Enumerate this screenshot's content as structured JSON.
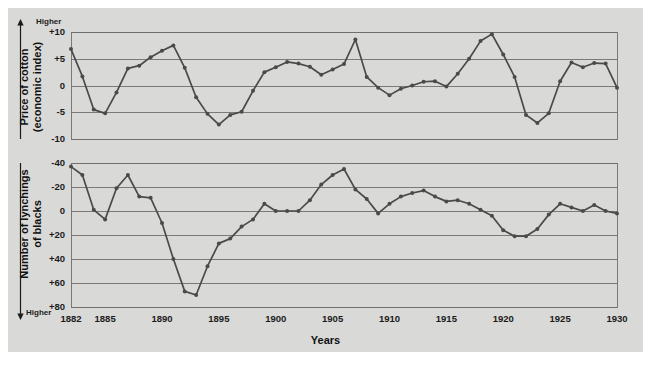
{
  "figure": {
    "background_color": "#d9d9d7",
    "page_color": "#ffffff",
    "line_color": "#4a4a4a",
    "grid_color": "#6f6f6f",
    "text_color": "#1b1b1b",
    "x_axis_label": "Years",
    "higher_top_label": "Higher",
    "higher_bottom_label": "Higher"
  },
  "chart_data": [
    {
      "type": "line",
      "id": "cotton-price",
      "title": "",
      "ylabel": "Price of cotton (economic index)",
      "ylabel_line1": "Price of cotton",
      "ylabel_line2": "(economic index)",
      "xlabel": "Years",
      "grid": true,
      "legend": "none",
      "axis_direction_note": "arrow points up, labelled Higher",
      "ylim": [
        -10,
        10
      ],
      "yticks": [
        10,
        5,
        0,
        -5,
        -10
      ],
      "ytick_labels": [
        "+10",
        "+5",
        "0",
        "-5",
        "-10"
      ],
      "xlim": [
        1882,
        1930
      ],
      "xticks": [
        1882,
        1885,
        1890,
        1895,
        1900,
        1905,
        1910,
        1915,
        1920,
        1925,
        1930
      ],
      "xtick_labels": [
        "1882",
        "1885",
        "1890",
        "1895",
        "1900",
        "1905",
        "1910",
        "1915",
        "1920",
        "1925",
        "1930"
      ],
      "x": [
        1882,
        1883,
        1884,
        1885,
        1886,
        1887,
        1888,
        1889,
        1890,
        1891,
        1892,
        1893,
        1894,
        1895,
        1896,
        1897,
        1898,
        1899,
        1900,
        1901,
        1902,
        1903,
        1904,
        1905,
        1906,
        1907,
        1908,
        1909,
        1910,
        1911,
        1912,
        1913,
        1914,
        1915,
        1916,
        1917,
        1918,
        1919,
        1920,
        1921,
        1922,
        1923,
        1924,
        1925,
        1926,
        1927,
        1928,
        1929,
        1930
      ],
      "y": [
        6.8,
        1.7,
        -4.5,
        -5.2,
        -1.3,
        3.2,
        3.7,
        5.3,
        6.5,
        7.5,
        3.3,
        -2.2,
        -5.3,
        -7.3,
        -5.5,
        -4.9,
        -1.0,
        2.5,
        3.4,
        4.4,
        4.1,
        3.5,
        2.0,
        3.0,
        4.0,
        8.6,
        1.6,
        -0.4,
        -1.8,
        -0.6,
        0.0,
        0.7,
        0.8,
        -0.2,
        2.2,
        5.0,
        8.3,
        9.6,
        5.8,
        1.6,
        -5.5,
        -7.0,
        -5.2,
        0.8,
        4.3,
        3.4,
        4.2,
        4.1,
        -0.4,
        -11.0
      ]
    },
    {
      "type": "line",
      "id": "lynchings",
      "title": "",
      "ylabel": "Number of lynchings of blacks",
      "ylabel_line1": "Number of lynchings",
      "ylabel_line2": "of blacks",
      "xlabel": "Years",
      "grid": true,
      "legend": "none",
      "axis_direction_note": "axis inverted, arrow points down, labelled Higher",
      "ylim": [
        -40,
        80
      ],
      "yticks": [
        -40,
        -20,
        0,
        20,
        40,
        60,
        80
      ],
      "ytick_labels": [
        "-40",
        "-20",
        "0",
        "+20",
        "+40",
        "+60",
        "+80"
      ],
      "xlim": [
        1882,
        1930
      ],
      "xticks": [
        1882,
        1885,
        1890,
        1895,
        1900,
        1905,
        1910,
        1915,
        1920,
        1925,
        1930
      ],
      "xtick_labels": [
        "1882",
        "1885",
        "1890",
        "1895",
        "1900",
        "1905",
        "1910",
        "1915",
        "1920",
        "1925",
        "1930"
      ],
      "x": [
        1882,
        1883,
        1884,
        1885,
        1886,
        1887,
        1888,
        1889,
        1890,
        1891,
        1892,
        1893,
        1894,
        1895,
        1896,
        1897,
        1898,
        1899,
        1900,
        1901,
        1902,
        1903,
        1904,
        1905,
        1906,
        1907,
        1908,
        1909,
        1910,
        1911,
        1912,
        1913,
        1914,
        1915,
        1916,
        1917,
        1918,
        1919,
        1920,
        1921,
        1922,
        1923,
        1924,
        1925,
        1926,
        1927,
        1928,
        1929,
        1930
      ],
      "y": [
        -37,
        -30,
        -1,
        7,
        -19,
        -30,
        -12,
        -11,
        10,
        40,
        67,
        70,
        46,
        27,
        23,
        13,
        7,
        -6,
        0,
        0,
        0,
        -9,
        -22,
        -30,
        -35,
        -18,
        -10,
        2,
        -6,
        -12,
        -15,
        -17,
        -12,
        -8,
        -9,
        -6,
        -1,
        4,
        16,
        21,
        21,
        15,
        3,
        -6,
        -3,
        0,
        -5,
        0,
        2
      ]
    }
  ]
}
